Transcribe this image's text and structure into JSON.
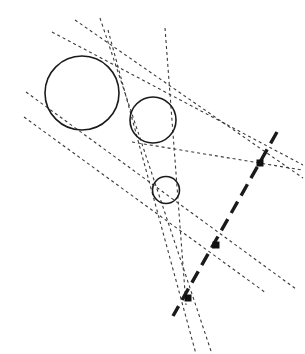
{
  "figure": {
    "width": 305,
    "height": 354,
    "background_color": "#ffffff",
    "stroke_color": "#1a1a1a",
    "tangent_color": "#3a3a3a",
    "node_color": "#111111"
  },
  "circles": [
    {
      "name": "large-circle",
      "cx": 82,
      "cy": 93,
      "r": 37,
      "stroke_width": 1.6,
      "label": "Circle A (large)"
    },
    {
      "name": "medium-circle",
      "cx": 153,
      "cy": 120,
      "r": 23,
      "stroke_width": 1.6,
      "label": "Circle B (medium)"
    },
    {
      "name": "small-circle",
      "cx": 166,
      "cy": 190,
      "r": 13.5,
      "stroke_width": 1.6,
      "label": "Circle C (small)"
    }
  ],
  "nodes": [
    {
      "name": "homothety-center-upper",
      "x": 260,
      "y": 163,
      "size": 6,
      "label": "External center AB"
    },
    {
      "name": "homothety-center-middle",
      "x": 216,
      "y": 245,
      "size": 6,
      "label": "External center AC"
    },
    {
      "name": "homothety-center-lower",
      "x": 188,
      "y": 298,
      "size": 6,
      "label": "External center BC"
    }
  ],
  "center_line": {
    "name": "monge-line",
    "x1": 277,
    "y1": 132,
    "x2": 173,
    "y2": 316,
    "stroke_width": 3.4,
    "dash": "13 7",
    "label": "Monge line (collinear centers)"
  },
  "tangent_lines": [
    {
      "name": "tangent-1",
      "x1": 75,
      "y1": 20,
      "x2": 303,
      "y2": 178,
      "stroke_width": 1.1,
      "dash": "3 3"
    },
    {
      "name": "tangent-2",
      "x1": 52,
      "y1": 32,
      "x2": 303,
      "y2": 165,
      "stroke_width": 1.1,
      "dash": "3 3"
    },
    {
      "name": "tangent-3",
      "x1": 100,
      "y1": 18,
      "x2": 212,
      "y2": 354,
      "stroke_width": 1.1,
      "dash": "3 3"
    },
    {
      "name": "tangent-4",
      "x1": 108,
      "y1": 30,
      "x2": 196,
      "y2": 354,
      "stroke_width": 1.1,
      "dash": "3 3"
    },
    {
      "name": "tangent-5",
      "x1": 26,
      "y1": 92,
      "x2": 296,
      "y2": 289,
      "stroke_width": 1.1,
      "dash": "3 3"
    },
    {
      "name": "tangent-6",
      "x1": 24,
      "y1": 117,
      "x2": 266,
      "y2": 293,
      "stroke_width": 1.1,
      "dash": "3 3"
    },
    {
      "name": "tangent-7",
      "x1": 165,
      "y1": 28,
      "x2": 186,
      "y2": 305,
      "stroke_width": 1.1,
      "dash": "3 3"
    },
    {
      "name": "tangent-8",
      "x1": 132,
      "y1": 142,
      "x2": 302,
      "y2": 170,
      "stroke_width": 1.1,
      "dash": "3 3"
    }
  ]
}
